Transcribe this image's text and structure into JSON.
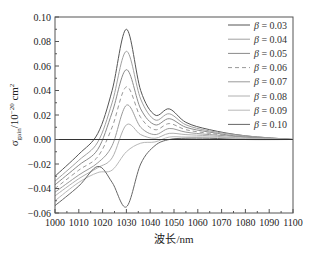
{
  "chart_data": {
    "type": "line",
    "title": "",
    "xlabel": "波长/nm",
    "ylabel": "σ_gain/10^-20 cm^2",
    "xlim": [
      1000,
      1100
    ],
    "ylim": [
      -0.06,
      0.1
    ],
    "x_ticks": [
      1000,
      1010,
      1020,
      1030,
      1040,
      1050,
      1060,
      1070,
      1080,
      1090,
      1100
    ],
    "y_ticks": [
      "-0.06",
      "-0.04",
      "-0.02",
      "0.00",
      "0.02",
      "0.04",
      "0.06",
      "0.08",
      "0.10"
    ],
    "grid": false,
    "legend_position": "upper right",
    "x": [
      1000,
      1010,
      1018,
      1024,
      1030,
      1036,
      1042,
      1048,
      1055,
      1065,
      1080,
      1100
    ],
    "series": [
      {
        "name": "β = 0.03",
        "color": "#555555",
        "dash": false,
        "values": [
          -0.03,
          -0.012,
          0.005,
          0.04,
          0.09,
          0.04,
          0.02,
          0.025,
          0.014,
          0.008,
          0.003,
          0.0
        ]
      },
      {
        "name": "β = 0.04",
        "color": "#a0a0a0",
        "dash": false,
        "values": [
          -0.034,
          -0.017,
          -0.002,
          0.03,
          0.072,
          0.033,
          0.016,
          0.021,
          0.012,
          0.007,
          0.003,
          0.0
        ]
      },
      {
        "name": "β = 0.05",
        "color": "#8a8a8a",
        "dash": false,
        "values": [
          -0.037,
          -0.021,
          -0.008,
          0.022,
          0.057,
          0.025,
          0.012,
          0.017,
          0.01,
          0.006,
          0.002,
          0.0
        ]
      },
      {
        "name": "β = 0.06",
        "color": "#999999",
        "dash": true,
        "values": [
          -0.04,
          -0.025,
          -0.014,
          0.01,
          0.043,
          0.018,
          0.008,
          0.013,
          0.008,
          0.005,
          0.002,
          0.0
        ]
      },
      {
        "name": "β = 0.07",
        "color": "#9a9a9a",
        "dash": false,
        "values": [
          -0.043,
          -0.029,
          -0.019,
          -0.005,
          0.028,
          0.01,
          0.004,
          0.009,
          0.006,
          0.004,
          0.002,
          0.0
        ]
      },
      {
        "name": "β = 0.08",
        "color": "#b0b0b0",
        "dash": false,
        "values": [
          -0.046,
          -0.032,
          -0.023,
          -0.015,
          0.012,
          0.004,
          0.001,
          0.005,
          0.004,
          0.003,
          0.001,
          0.0
        ]
      },
      {
        "name": "β = 0.09",
        "color": "#b8b8b8",
        "dash": false,
        "values": [
          -0.05,
          -0.035,
          -0.027,
          -0.025,
          -0.01,
          -0.003,
          -0.002,
          0.002,
          0.002,
          0.002,
          0.001,
          0.0
        ]
      },
      {
        "name": "β = 0.10",
        "color": "#666666",
        "dash": false,
        "values": [
          -0.054,
          -0.038,
          -0.022,
          -0.035,
          -0.055,
          -0.02,
          -0.005,
          0.0,
          0.001,
          0.001,
          0.0,
          0.0
        ]
      }
    ]
  }
}
